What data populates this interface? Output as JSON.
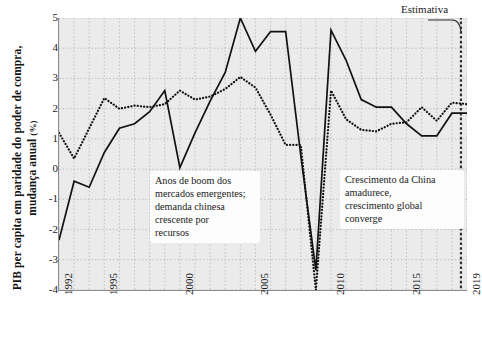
{
  "chart_data": {
    "type": "line",
    "title": "",
    "subtitle": "",
    "xlabel": "",
    "ylabel": "PIB per capita em paridade do poder de compra, mudança anual (%)",
    "ylabel_main": "PIB per capita em paridade do poder de compra, mudança anual",
    "ylabel_unit": "(%)",
    "xlim": [
      1992,
      2019
    ],
    "ylim": [
      -4,
      5
    ],
    "grid": true,
    "legend_position": "none",
    "y_ticks": [
      5,
      4,
      3,
      2,
      1,
      0,
      -1,
      -2,
      -3,
      -4
    ],
    "y_tick_labels": [
      "5",
      "4",
      "3",
      "2",
      "1",
      "0",
      "-1",
      "-2",
      "-3",
      "-4"
    ],
    "x_ticks": [
      1992,
      1995,
      2000,
      2005,
      2010,
      2015,
      2019
    ],
    "x_tick_labels": [
      "1992",
      "1995",
      "2000",
      "2005",
      "2010",
      "2015",
      "2019"
    ],
    "x": [
      1992,
      1993,
      1994,
      1995,
      1996,
      1997,
      1998,
      1999,
      2000,
      2001,
      2002,
      2003,
      2004,
      2005,
      2006,
      2007,
      2008,
      2009,
      2010,
      2011,
      2012,
      2013,
      2014,
      2015,
      2016,
      2017,
      2018,
      2019
    ],
    "series": [
      {
        "name": "solid-series",
        "style": "solid",
        "color": "#111111",
        "values": [
          -2.35,
          -0.4,
          -0.6,
          0.55,
          1.35,
          1.5,
          1.9,
          2.6,
          0.05,
          1.2,
          2.25,
          3.2,
          5.0,
          3.9,
          4.55,
          4.55,
          0.45,
          -3.35,
          4.6,
          3.6,
          2.3,
          2.05,
          2.05,
          1.5,
          1.1,
          1.1,
          1.85,
          1.85
        ]
      },
      {
        "name": "dotted-series",
        "style": "dotted",
        "color": "#111111",
        "values": [
          1.2,
          0.35,
          1.35,
          2.35,
          2.0,
          2.1,
          2.05,
          2.15,
          2.6,
          2.3,
          2.4,
          2.65,
          3.05,
          2.7,
          1.8,
          0.8,
          0.8,
          -4.0,
          2.6,
          1.65,
          1.3,
          1.25,
          1.5,
          1.55,
          2.05,
          1.6,
          2.2,
          2.15
        ]
      }
    ],
    "estimate_boundary_x": 2018.6,
    "annotations": [
      {
        "name": "boom-years-annotation",
        "text": "Anos de boom dos mercados emergentes; demanda chinesa crescente por recursos",
        "lines": [
          "Anos de boom dos",
          "mercados emergentes;",
          "demanda chinesa",
          "crescente por",
          "recursos"
        ]
      },
      {
        "name": "china-maturing-annotation",
        "text": "Crescimento da China amadurece, crescimento global converge",
        "lines": [
          "Crescimento da China",
          "amadurece,",
          "crescimento global",
          "converge"
        ]
      }
    ],
    "estimate_label": "Estimativa"
  },
  "colors": {
    "plot_background": "#ebebeb",
    "page_background": "#ffffff",
    "axis": "#8a8a8a",
    "gridline": "#b9b9b9",
    "line": "#111111",
    "text": "#1a1a1a"
  }
}
